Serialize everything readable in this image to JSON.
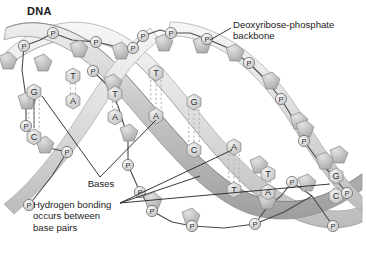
{
  "figure": {
    "title": "DNA",
    "type": "double-helix-diagram",
    "background_color": "#ffffff"
  },
  "colors": {
    "ribbon_front": "#c9c9c9",
    "ribbon_back": "#dedede",
    "ribbon_edge": "#8e8e8e",
    "sugar_fill": "#bdbdbd",
    "base_fill": "#d6d6d6",
    "phosphate_fill": "#f2f2f2",
    "bond_dash": "#b0b0b0",
    "text": "#1d1d1d",
    "leader": "#222222"
  },
  "labels": [
    {
      "id": "backbone",
      "text": "Deoxyribose-phosphate\nbackbone",
      "x": 233,
      "y": 23,
      "align": "left"
    },
    {
      "id": "bases",
      "text": "Bases",
      "x": 100,
      "y": 183,
      "align": "center"
    },
    {
      "id": "hydrogen-bonding",
      "text": "Hydrogen bonding\noccurs between\nbase pairs",
      "x": 33,
      "y": 203,
      "align": "left"
    }
  ],
  "legend_notes": {
    "phosphate_symbol": "P",
    "base_symbols": [
      "A",
      "T",
      "G",
      "C"
    ]
  },
  "base_pairs": [
    {
      "pair": [
        "G",
        "C"
      ],
      "top": {
        "letter": "G",
        "x": 34,
        "y": 92
      },
      "bottom": {
        "letter": "C",
        "x": 34,
        "y": 137
      },
      "bonds": 3
    },
    {
      "pair": [
        "T",
        "A"
      ],
      "top": {
        "letter": "T",
        "x": 73,
        "y": 76
      },
      "bottom": {
        "letter": "A",
        "x": 73,
        "y": 101
      },
      "bonds": 2
    },
    {
      "pair": [
        "T",
        "A"
      ],
      "top": {
        "letter": "T",
        "x": 115,
        "y": 94
      },
      "bottom": {
        "letter": "A",
        "x": 115,
        "y": 117
      },
      "bonds": 2
    },
    {
      "pair": [
        "T",
        "A"
      ],
      "top": {
        "letter": "T",
        "x": 156,
        "y": 73
      },
      "bottom": {
        "letter": "A",
        "x": 156,
        "y": 116
      },
      "bonds": 3
    },
    {
      "pair": [
        "G",
        "C"
      ],
      "top": {
        "letter": "G",
        "x": 194,
        "y": 102
      },
      "bottom": {
        "letter": "C",
        "x": 194,
        "y": 150
      },
      "bonds": 3
    },
    {
      "pair": [
        "A",
        "T"
      ],
      "top": {
        "letter": "A",
        "x": 234,
        "y": 147
      },
      "bottom": {
        "letter": "T",
        "x": 234,
        "y": 190
      },
      "bonds": 3
    },
    {
      "pair": [
        "T",
        "A"
      ],
      "top": {
        "letter": "T",
        "x": 268,
        "y": 174
      },
      "bottom": {
        "letter": "A",
        "x": 268,
        "y": 192
      },
      "bonds": 2
    },
    {
      "pair": [
        "G",
        "C"
      ],
      "top": {
        "letter": "G",
        "x": 336,
        "y": 176
      },
      "bottom": {
        "letter": "C",
        "x": 336,
        "y": 196
      },
      "bonds": 2
    }
  ],
  "phosphates": [
    {
      "x": 24,
      "y": 46
    },
    {
      "x": 53,
      "y": 33
    },
    {
      "x": 96,
      "y": 42
    },
    {
      "x": 133,
      "y": 48
    },
    {
      "x": 93,
      "y": 71
    },
    {
      "x": 26,
      "y": 126
    },
    {
      "x": 67,
      "y": 152
    },
    {
      "x": 29,
      "y": 205
    },
    {
      "x": 143,
      "y": 36
    },
    {
      "x": 171,
      "y": 33
    },
    {
      "x": 207,
      "y": 39
    },
    {
      "x": 249,
      "y": 63
    },
    {
      "x": 281,
      "y": 99
    },
    {
      "x": 304,
      "y": 141
    },
    {
      "x": 128,
      "y": 165
    },
    {
      "x": 140,
      "y": 192
    },
    {
      "x": 152,
      "y": 211
    },
    {
      "x": 192,
      "y": 226
    },
    {
      "x": 255,
      "y": 224
    },
    {
      "x": 292,
      "y": 182
    },
    {
      "x": 333,
      "y": 226
    },
    {
      "x": 347,
      "y": 193
    }
  ]
}
